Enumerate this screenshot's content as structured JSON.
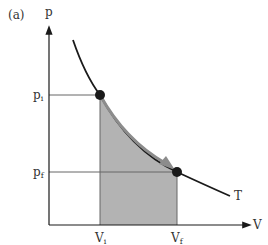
{
  "panel_label": "(a)",
  "axes": {
    "y_label": "p",
    "x_label": "V"
  },
  "pressure_levels": {
    "initial": {
      "base": "p",
      "sub": "i"
    },
    "final": {
      "base": "p",
      "sub": "f"
    }
  },
  "volume_levels": {
    "initial": {
      "base": "V",
      "sub": "i"
    },
    "final": {
      "base": "V",
      "sub": "f"
    }
  },
  "curve_label": "T",
  "colors": {
    "shaded_area": "#b3b3b3",
    "arrow": "#8c8c8c",
    "curve": "#1a1a1a",
    "guide_lines": "#555555",
    "points": "#1a1a1a"
  }
}
